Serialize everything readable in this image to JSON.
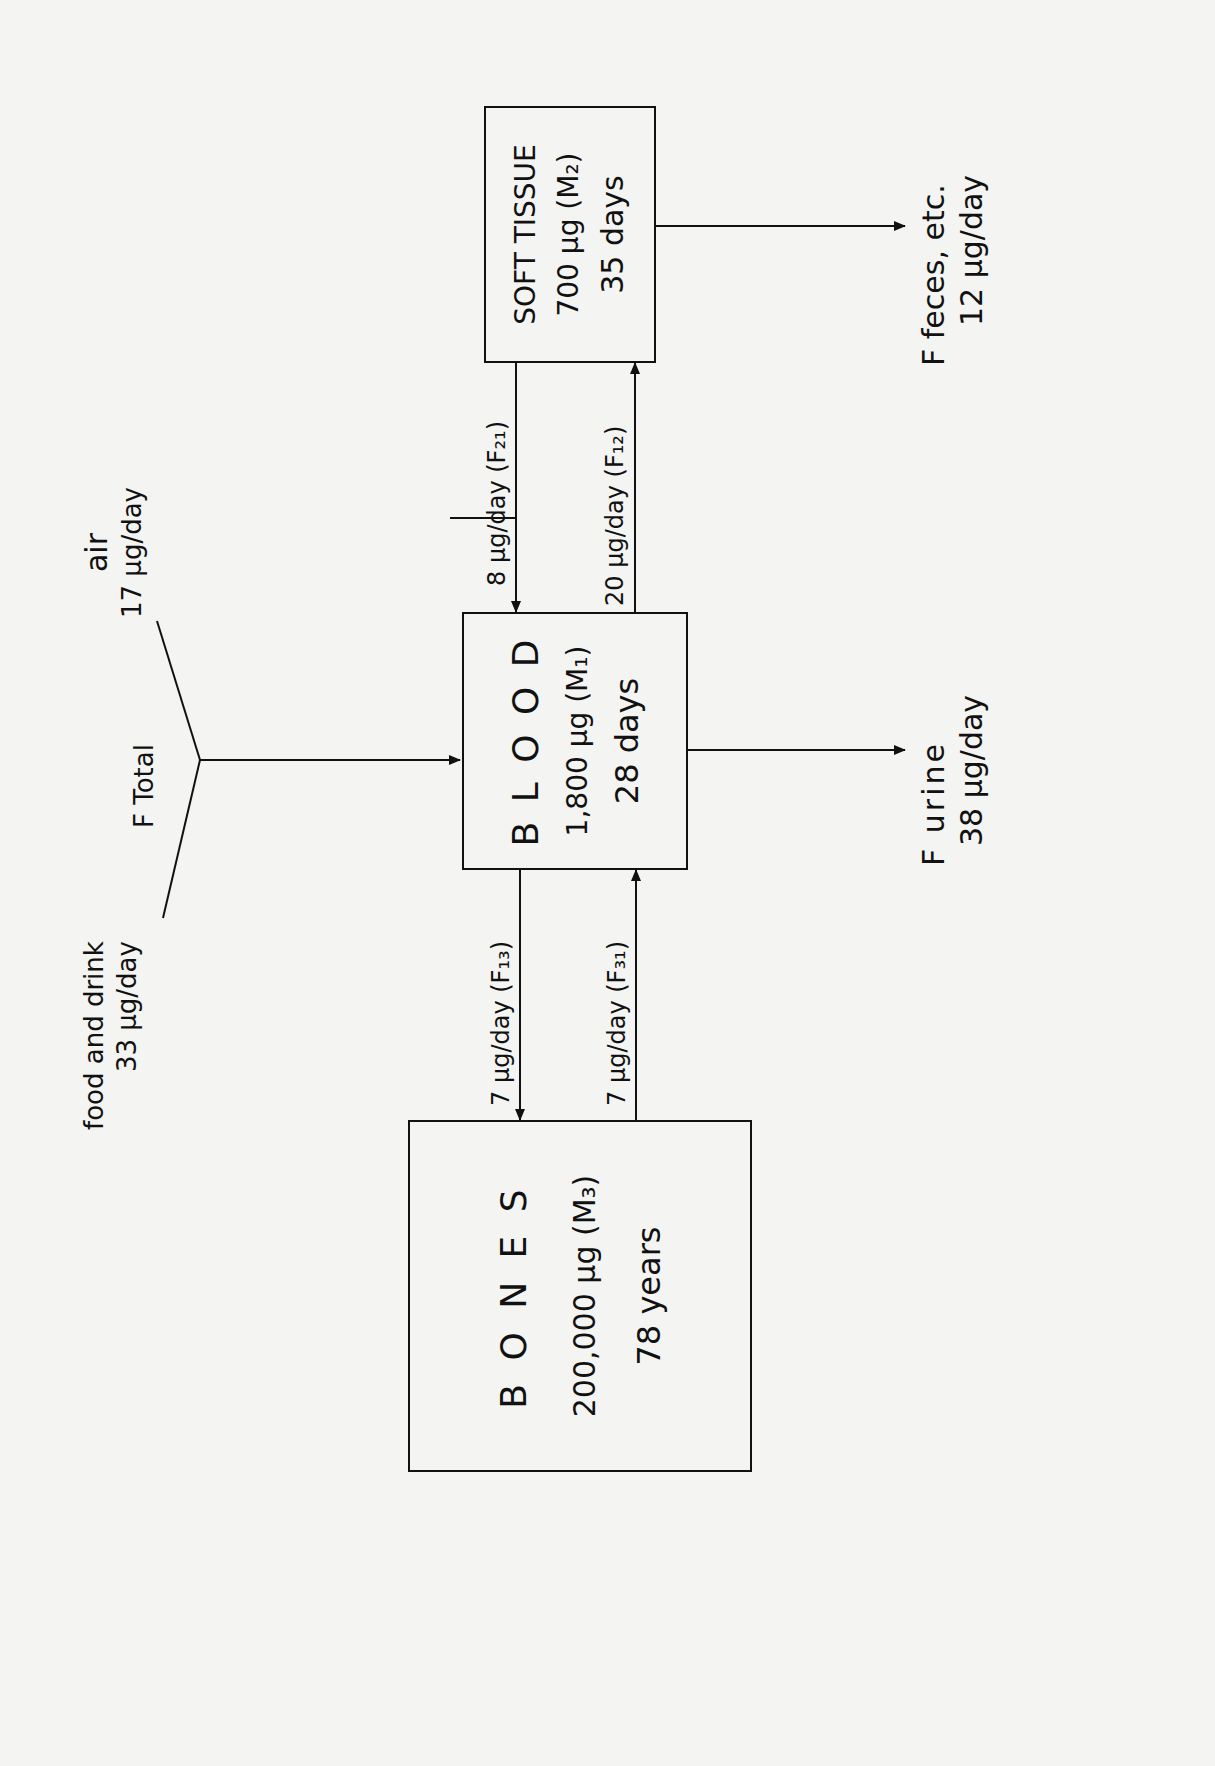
{
  "compartments": {
    "bones": {
      "name": "B O N E S",
      "mass": "200,000 µg (M₃)",
      "time": "78 years"
    },
    "blood": {
      "name": "B L O O D",
      "mass": "1,800 µg (M₁)",
      "time": "28 days"
    },
    "soft_tissue": {
      "name": "SOFT TISSUE",
      "mass": "700 µg (M₂)",
      "time": "35 days"
    }
  },
  "inputs": {
    "food": {
      "label": "food and drink",
      "value": "33 µg/day"
    },
    "air": {
      "label": "air",
      "value": "17 µg/day"
    },
    "total": {
      "label": "F Total"
    }
  },
  "flows": {
    "f21": "8 µg/day (F₂₁)",
    "f12": "20 µg/day (F₁₂)",
    "f13": "7 µg/day (F₁₃)",
    "f31": "7 µg/day (F₃₁)"
  },
  "outputs": {
    "urine": {
      "label": "F urine",
      "value": "38 µg/day"
    },
    "feces": {
      "label": "F feces, etc.",
      "value": "12 µg/day"
    }
  }
}
